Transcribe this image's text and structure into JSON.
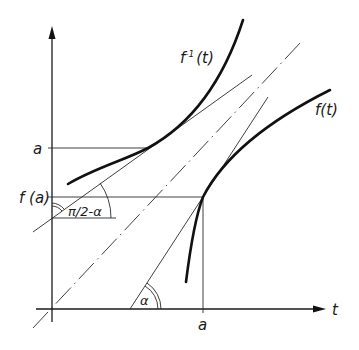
{
  "figure": {
    "type": "inverse-function-derivative-diagram",
    "axes": {
      "horizontal_label": "t",
      "vertical_label": ""
    },
    "curves": [
      {
        "name": "f",
        "label": "f(t)"
      },
      {
        "name": "f_inverse",
        "label": "f⁻¹(t)",
        "label_base": "f",
        "label_sup": "-1",
        "label_arg": "(t)"
      }
    ],
    "tick_labels": {
      "x_a": "a",
      "y_a": "a",
      "y_fa": "f (a)"
    },
    "angles": {
      "alpha": "α",
      "complement": "π/2 − α",
      "complement_display": "π/2-α"
    },
    "reference_line": "t = y (dash-dot diagonal)",
    "colors": {
      "ink": "#111111",
      "background": "#ffffff"
    }
  }
}
